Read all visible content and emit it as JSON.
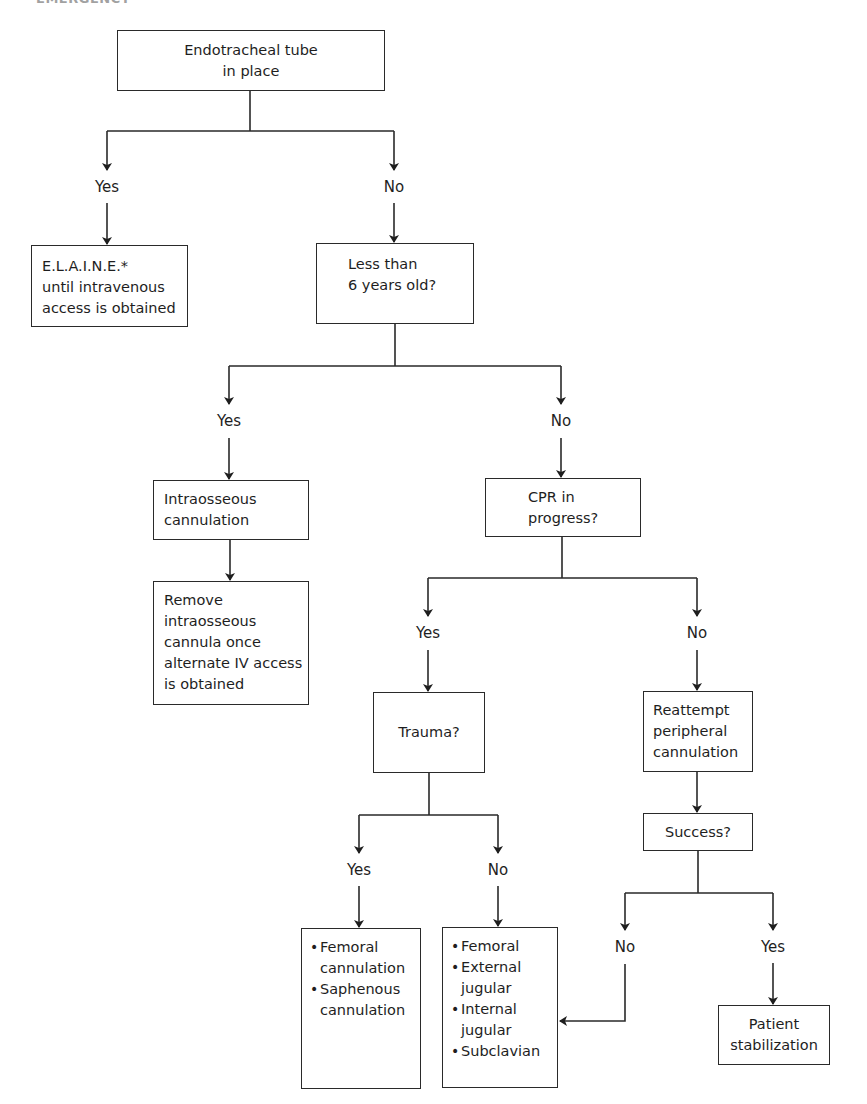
{
  "header": {
    "running_head": "EMERGENCY"
  },
  "nodes": {
    "start": {
      "lines": [
        "Endotracheal tube",
        "in place"
      ]
    },
    "elaine": {
      "lines": [
        "E.L.A.I.N.E.*",
        "until intravenous",
        "access is obtained"
      ]
    },
    "age": {
      "lines": [
        "Less than",
        "6 years old?"
      ]
    },
    "io": {
      "lines": [
        "Intraosseous",
        "cannulation"
      ]
    },
    "remove": {
      "lines": [
        "Remove",
        "intraosseous",
        "cannula once",
        "alternate IV access",
        "is obtained"
      ]
    },
    "cpr": {
      "lines": [
        "CPR in",
        "progress?"
      ]
    },
    "trauma": {
      "lines": [
        "Trauma?"
      ]
    },
    "reattempt": {
      "lines": [
        "Reattempt",
        "peripheral",
        "cannulation"
      ]
    },
    "success": {
      "lines": [
        "Success?"
      ]
    },
    "trauma_yes": {
      "items": [
        [
          "Femoral",
          "cannulation"
        ],
        [
          "Saphenous",
          "cannulation"
        ]
      ]
    },
    "trauma_no": {
      "items": [
        [
          "Femoral"
        ],
        [
          "External",
          "jugular"
        ],
        [
          "Internal",
          "jugular"
        ],
        [
          "Subclavian"
        ]
      ]
    },
    "patient": {
      "lines": [
        "Patient",
        "stabilization"
      ]
    }
  },
  "labels": {
    "start_yes": "Yes",
    "start_no": "No",
    "age_yes": "Yes",
    "age_no": "No",
    "cpr_yes": "Yes",
    "cpr_no": "No",
    "trauma_yes": "Yes",
    "trauma_no": "No",
    "success_no": "No",
    "success_yes": "Yes"
  }
}
